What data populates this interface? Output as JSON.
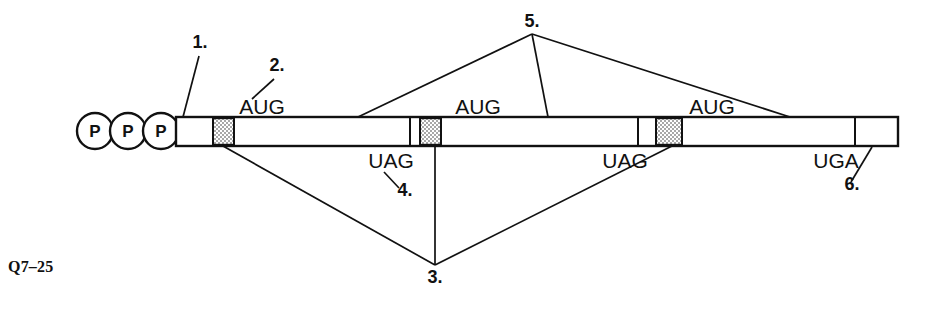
{
  "figure": {
    "caption": "Q7–25",
    "colors": {
      "stroke": "#111111",
      "background": "#ffffff",
      "stipple": "#b9b9b9"
    }
  },
  "mrna": {
    "cap_label": "P",
    "cap_count": 3,
    "cap_phosphates": [
      "P",
      "P",
      "P"
    ],
    "start_codons": [
      {
        "label": "AUG",
        "x": 262,
        "y": 117
      },
      {
        "label": "AUG",
        "x": 478,
        "y": 117
      },
      {
        "label": "AUG",
        "x": 712,
        "y": 117
      }
    ],
    "stop_codons": [
      {
        "label": "UAG",
        "x": 391,
        "y": 164
      },
      {
        "label": "UAG",
        "x": 625,
        "y": 164
      },
      {
        "label": "UGA",
        "x": 836,
        "y": 164
      }
    ]
  },
  "callouts": [
    {
      "id": "1",
      "label": "1.",
      "x": 200,
      "y": 48
    },
    {
      "id": "2",
      "label": "2.",
      "x": 277,
      "y": 71
    },
    {
      "id": "3",
      "label": "3.",
      "x": 435,
      "y": 283
    },
    {
      "id": "4",
      "label": "4.",
      "x": 405,
      "y": 196
    },
    {
      "id": "5",
      "label": "5.",
      "x": 532,
      "y": 27
    },
    {
      "id": "6",
      "label": "6.",
      "x": 852,
      "y": 190
    }
  ]
}
